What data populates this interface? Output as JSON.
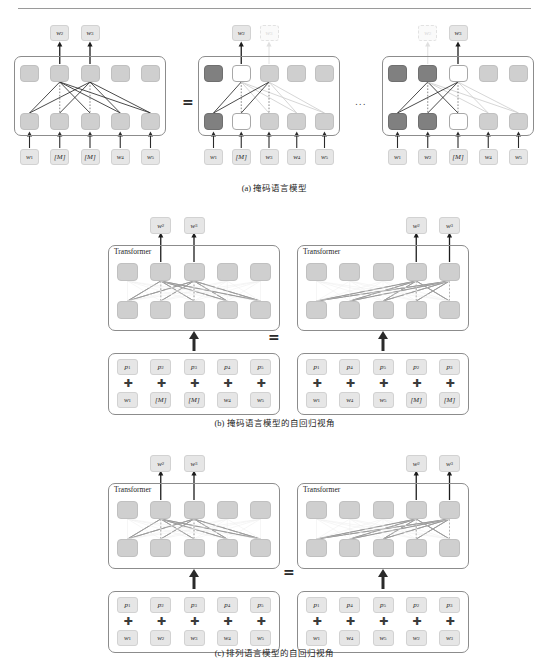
{
  "page": {
    "running_head": "",
    "background": "#ffffff"
  },
  "colors": {
    "hidden_state": "#cfcfcf",
    "hidden_state_dark": "#808080",
    "hidden_state_white": "#ffffff",
    "chip": "#e6e6e6",
    "panel_border": "#8c8c8c",
    "text": "#231f20",
    "faded": "#d8d8d8"
  },
  "symbols": {
    "equals": "=",
    "ellipsis": "...",
    "plus": "✚",
    "transformer_label": "Transformer"
  },
  "figure_a": {
    "caption": "(a) 掩码语言模型",
    "diagrams": [
      {
        "name": "mlm-joint",
        "outputs": [
          {
            "label": "w₂",
            "state": "solid"
          },
          {
            "label": "w₃",
            "state": "solid"
          }
        ],
        "output_columns": [
          2,
          3
        ],
        "top_cells": [
          "gray",
          "gray",
          "gray",
          "gray",
          "gray"
        ],
        "bottom_cells": [
          "gray",
          "gray",
          "gray",
          "gray",
          "gray"
        ],
        "inputs": [
          "w₁",
          "[M]",
          "[M]",
          "w₄",
          "w₅"
        ]
      },
      {
        "name": "mlm-factor-1",
        "outputs": [
          {
            "label": "w₂",
            "state": "solid"
          },
          {
            "label": "w₃",
            "state": "faded"
          }
        ],
        "output_columns": [
          2,
          3
        ],
        "top_cells": [
          "dark",
          "white",
          "gray",
          "gray",
          "gray"
        ],
        "bottom_cells": [
          "dark",
          "white",
          "gray",
          "gray",
          "gray"
        ],
        "inputs": [
          "w₁",
          "[M]",
          "w₃",
          "w₄",
          "w₅"
        ]
      },
      {
        "name": "mlm-factor-2",
        "outputs": [
          {
            "label": "w₂",
            "state": "faded"
          },
          {
            "label": "w₃",
            "state": "solid"
          }
        ],
        "output_columns": [
          2,
          3
        ],
        "top_cells": [
          "dark",
          "dark",
          "white",
          "gray",
          "gray"
        ],
        "bottom_cells": [
          "dark",
          "dark",
          "white",
          "gray",
          "gray"
        ],
        "inputs": [
          "w₁",
          "w₂",
          "[M]",
          "w₄",
          "w₅"
        ]
      }
    ]
  },
  "figure_b": {
    "caption": "(b) 掩码语言模型的自回归视角",
    "left": {
      "name": "mlm-ar-left",
      "transformer_label": "Transformer",
      "outputs": [
        "w₂",
        "w₃"
      ],
      "output_columns": [
        2,
        3
      ],
      "positions": [
        "p₁",
        "p₂",
        "p₃",
        "p₄",
        "p₅"
      ],
      "tokens": [
        "w₁",
        "[M]",
        "[M]",
        "w₄",
        "w₅"
      ]
    },
    "right": {
      "name": "mlm-ar-right",
      "transformer_label": "Transformer",
      "outputs": [
        "w₂",
        "w₃"
      ],
      "output_columns": [
        4,
        5
      ],
      "positions": [
        "p₁",
        "p₄",
        "p₅",
        "p₂",
        "p₃"
      ],
      "tokens": [
        "w₁",
        "w₄",
        "w₅",
        "[M]",
        "[M]"
      ]
    }
  },
  "figure_c": {
    "caption": "(c) 排列语言模型的自回归视角",
    "left": {
      "name": "plm-ar-left",
      "transformer_label": "Transformer",
      "outputs": [
        "w₂",
        "w₃"
      ],
      "output_columns": [
        2,
        3
      ],
      "positions": [
        "p₁",
        "p₂",
        "p₃",
        "p₄",
        "p₅"
      ],
      "tokens": [
        "w₁",
        "w₂",
        "w₃",
        "w₄",
        "w₅"
      ]
    },
    "right": {
      "name": "plm-ar-right",
      "transformer_label": "Transformer",
      "outputs": [
        "w₂",
        "w₃"
      ],
      "output_columns": [
        4,
        5
      ],
      "positions": [
        "p₁",
        "p₄",
        "p₅",
        "p₂",
        "p₃"
      ],
      "tokens": [
        "w₁",
        "w₄",
        "w₅",
        "w₂",
        "w₃"
      ]
    }
  }
}
